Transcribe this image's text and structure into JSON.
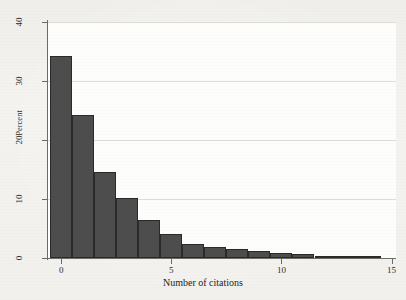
{
  "figure": {
    "background_color": "#f2f1ee",
    "plot_background_color": "#fdfdfc",
    "bar_fill_color": "#4d4d4d",
    "bar_edge_color": "#2a2a2a",
    "gridline_color": "#dedcd6",
    "axis_color": "#6b6b68"
  },
  "chart_data": {
    "type": "bar",
    "title": "",
    "subtitle": "",
    "xlabel": "Number of citations",
    "ylabel": "Percent",
    "xlim": [
      -0.6,
      15.2
    ],
    "ylim": [
      0,
      40
    ],
    "xticks": [
      0,
      5,
      10,
      15
    ],
    "xtick_labels": [
      "0",
      "5",
      "10",
      "15"
    ],
    "yticks": [
      0,
      10,
      20,
      30,
      40
    ],
    "ytick_labels": [
      "0",
      "10",
      "20",
      "30",
      "40"
    ],
    "grid": "horizontal",
    "legend": "none",
    "bin_width": 1,
    "categories": [
      0,
      1,
      2,
      3,
      4,
      5,
      6,
      7,
      8,
      9,
      10,
      11,
      12,
      13,
      14
    ],
    "values": [
      34.3,
      24.3,
      14.6,
      10.2,
      6.4,
      4.0,
      2.3,
      1.9,
      1.5,
      1.2,
      0.9,
      0.7,
      0.4,
      0.1,
      0.3
    ],
    "series": [
      {
        "name": "Percent of papers",
        "values": [
          34.3,
          24.3,
          14.6,
          10.2,
          6.4,
          4.0,
          2.3,
          1.9,
          1.5,
          1.2,
          0.9,
          0.7,
          0.4,
          0.1,
          0.3
        ]
      }
    ],
    "annotations": []
  }
}
